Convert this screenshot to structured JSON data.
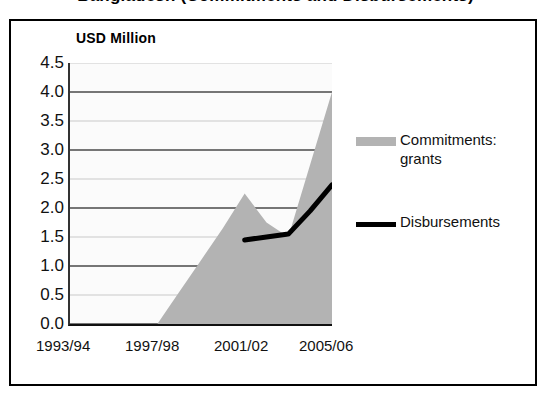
{
  "chart_title": "Bangladesh (Commitments and Disbursements)",
  "axis_title": "USD Million",
  "legend": {
    "items": [
      {
        "label": "Commitments: grants",
        "swatch": "area-swatch-icon",
        "color": "#b3b3b3"
      },
      {
        "label": "Disbursements",
        "swatch": "line-swatch-icon",
        "color": "#000000"
      }
    ]
  },
  "y_axis": {
    "ticks": [
      "4.5",
      "4.0",
      "3.5",
      "3.0",
      "2.5",
      "2.0",
      "1.5",
      "1.0",
      "0.5",
      "0.0"
    ]
  },
  "x_axis": {
    "tick_labels": [
      "1993/94",
      "1997/98",
      "2001/02",
      "2005/06"
    ]
  },
  "chart_data": {
    "type": "area",
    "title": "Bangladesh (Commitments and Disbursements)",
    "xlabel": "",
    "ylabel": "USD Million",
    "ylim": [
      0.0,
      4.5
    ],
    "ytick_values": [
      0.0,
      0.5,
      1.0,
      1.5,
      2.0,
      2.5,
      3.0,
      3.5,
      4.0,
      4.5
    ],
    "grid": true,
    "legend_position": "right",
    "categories": [
      "1993/94",
      "1994/95",
      "1995/96",
      "1996/97",
      "1997/98",
      "1998/99",
      "1999/00",
      "2000/01",
      "2001/02",
      "2002/03",
      "2003/04",
      "2004/05",
      "2005/06"
    ],
    "series": [
      {
        "name": "Commitments: grants",
        "type": "area",
        "color": "#b3b3b3",
        "values": [
          0.0,
          0.0,
          0.0,
          0.0,
          0.0,
          0.55,
          1.1,
          1.65,
          2.25,
          1.75,
          1.5,
          2.75,
          4.0
        ]
      },
      {
        "name": "Disbursements",
        "type": "line",
        "color": "#000000",
        "values": [
          null,
          null,
          null,
          null,
          null,
          null,
          null,
          null,
          1.45,
          1.5,
          1.55,
          1.95,
          2.4
        ]
      }
    ]
  }
}
